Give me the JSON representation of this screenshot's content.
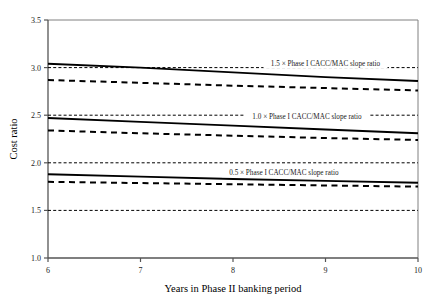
{
  "chart_data": {
    "type": "line",
    "title": "",
    "xlabel": "Years in Phase II banking period",
    "ylabel": "Cost ratio",
    "xlim": [
      6,
      10
    ],
    "ylim": [
      1.0,
      3.5
    ],
    "xticks": [
      "6",
      "7",
      "8",
      "9",
      "10"
    ],
    "yticks": [
      "1.0",
      "1.5",
      "2.0",
      "2.5",
      "3.0",
      "3.5"
    ],
    "xtick_values": [
      6,
      7,
      8,
      9,
      10
    ],
    "ytick_values": [
      1.0,
      1.5,
      2.0,
      2.5,
      3.0,
      3.5
    ],
    "grid": "horizontal dotted gridlines at 1.5, 2.0, 2.5, 3.0",
    "legend_position": "inline annotations on plot",
    "x": [
      6,
      7,
      8,
      9,
      10
    ],
    "series": [
      {
        "name": "1.5 x Phase I CACC/MAC slope ratio - solid",
        "style": "solid",
        "color": "#000000",
        "values": [
          3.04,
          3.0,
          2.95,
          2.9,
          2.86
        ]
      },
      {
        "name": "1.5 x Phase I CACC/MAC slope ratio - dashed",
        "style": "dashed",
        "color": "#000000",
        "values": [
          2.87,
          2.84,
          2.81,
          2.785,
          2.76
        ]
      },
      {
        "name": "1.0 x Phase I CACC/MAC slope ratio - solid",
        "style": "solid",
        "color": "#000000",
        "values": [
          2.47,
          2.43,
          2.39,
          2.35,
          2.31
        ]
      },
      {
        "name": "1.0 x Phase I CACC/MAC slope ratio - dashed",
        "style": "dashed",
        "color": "#000000",
        "values": [
          2.34,
          2.31,
          2.285,
          2.26,
          2.24
        ]
      },
      {
        "name": "0.5 x Phase I CACC/MAC slope ratio - solid",
        "style": "solid",
        "color": "#000000",
        "values": [
          1.88,
          1.855,
          1.83,
          1.81,
          1.79
        ]
      },
      {
        "name": "0.5 x Phase I CACC/MAC slope ratio - dashed",
        "style": "dashed",
        "color": "#000000",
        "values": [
          1.8,
          1.787,
          1.775,
          1.762,
          1.75
        ]
      }
    ],
    "gridline_values": [
      1.5,
      2.0,
      2.5,
      3.0
    ],
    "annotations": [
      {
        "text": "1.5 × Phase I CACC/MAC slope ratio",
        "x": 9.0,
        "y": 3.02
      },
      {
        "text": "1.0 × Phase I CACC/MAC slope ratio",
        "x": 8.8,
        "y": 2.455
      },
      {
        "text": "0.5 × Phase I CACC/MAC slope ratio",
        "x": 8.55,
        "y": 1.875
      }
    ]
  }
}
